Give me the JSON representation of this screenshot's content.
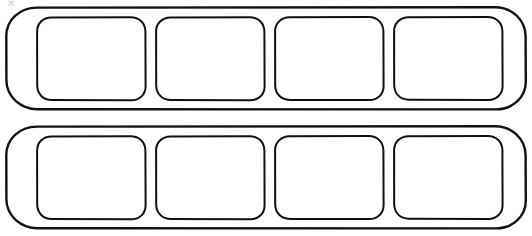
{
  "canvas": {
    "width": 532,
    "height": 236,
    "background_color": "#ffffff",
    "ink_color": "#111111",
    "title": "Two-Row Four-Cell Capsule Tray Diagram",
    "description": "Black line-art diagram on a white background showing two identical horizontal capsule (stadium) shaped outlines stacked vertically, each subdivided into four empty rounded-square cells."
  },
  "style": {
    "stroke_color": "#111111",
    "fill_color": "#ffffff",
    "tray_stroke_width": 2.4,
    "cell_stroke_width": 2.0,
    "tray_corner_radius": 30,
    "cell_corner_radius": 14
  },
  "diagram": {
    "type": "line-art-template",
    "row_count": 2,
    "cells_per_row": 4,
    "total_cells": 8,
    "cell_content": "",
    "rows": [
      {
        "id": "row-1",
        "label": "",
        "tray": {
          "x": 6,
          "y": 7,
          "width": 520,
          "height": 103,
          "rx": 30
        },
        "cells": [
          {
            "id": "row1-cell1",
            "label": "",
            "x": 37,
            "y": 17,
            "width": 108,
            "height": 83,
            "rx": 14
          },
          {
            "id": "row1-cell2",
            "label": "",
            "x": 156,
            "y": 17,
            "width": 108,
            "height": 83,
            "rx": 14
          },
          {
            "id": "row1-cell3",
            "label": "",
            "x": 275,
            "y": 17,
            "width": 108,
            "height": 83,
            "rx": 14
          },
          {
            "id": "row1-cell4",
            "label": "",
            "x": 394,
            "y": 17,
            "width": 108,
            "height": 83,
            "rx": 14
          }
        ]
      },
      {
        "id": "row-2",
        "label": "",
        "tray": {
          "x": 6,
          "y": 126,
          "width": 520,
          "height": 103,
          "rx": 30
        },
        "cells": [
          {
            "id": "row2-cell1",
            "label": "",
            "x": 37,
            "y": 136,
            "width": 108,
            "height": 83,
            "rx": 14
          },
          {
            "id": "row2-cell2",
            "label": "",
            "x": 156,
            "y": 136,
            "width": 108,
            "height": 83,
            "rx": 14
          },
          {
            "id": "row2-cell3",
            "label": "",
            "x": 275,
            "y": 136,
            "width": 108,
            "height": 83,
            "rx": 14
          },
          {
            "id": "row2-cell4",
            "label": "",
            "x": 394,
            "y": 136,
            "width": 108,
            "height": 83,
            "rx": 14
          }
        ]
      }
    ],
    "artifacts": [
      {
        "id": "top-left-speck",
        "description": "faint scan speck near top-left corner",
        "x": 11,
        "y": 2
      }
    ]
  }
}
